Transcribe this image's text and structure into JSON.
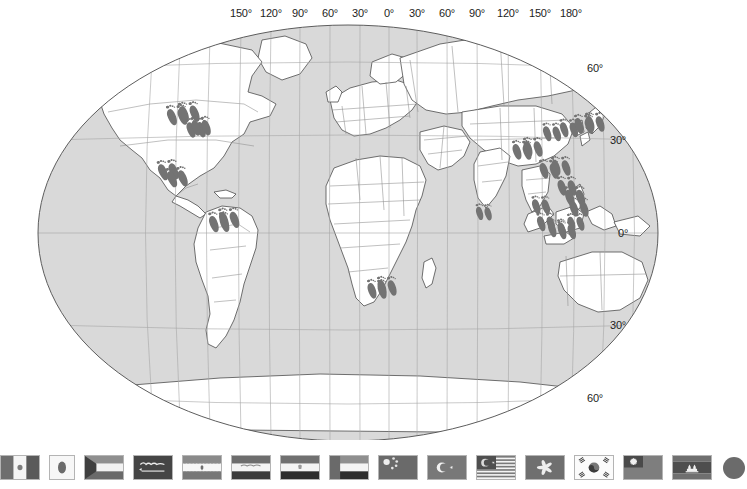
{
  "map": {
    "title": "World map with footprint markers",
    "projection": "Robinson",
    "ocean_color": "#d9d9d9",
    "land_color": "#ffffff",
    "border_color": "#8c8c8c",
    "coast_color": "#4d4d4d",
    "graticule_color": "#a6a6a6",
    "marker_color": "#737373",
    "marker_icon": "footprint-icon",
    "longitude_labels": [
      {
        "text": "150°",
        "x": 241
      },
      {
        "text": "120°",
        "x": 271
      },
      {
        "text": "90°",
        "x": 300
      },
      {
        "text": "60°",
        "x": 330
      },
      {
        "text": "30°",
        "x": 360
      },
      {
        "text": "0°",
        "x": 389
      },
      {
        "text": "30°",
        "x": 417
      },
      {
        "text": "60°",
        "x": 447
      },
      {
        "text": "90°",
        "x": 477
      },
      {
        "text": "120°",
        "x": 508
      },
      {
        "text": "150°",
        "x": 540
      },
      {
        "text": "180°",
        "x": 571
      }
    ],
    "latitude_labels": [
      {
        "text": "60°",
        "x": 587,
        "y": 68
      },
      {
        "text": "30°",
        "x": 610,
        "y": 140
      },
      {
        "text": "0°",
        "x": 618,
        "y": 233
      },
      {
        "text": "30°",
        "x": 610,
        "y": 325
      },
      {
        "text": "60°",
        "x": 587,
        "y": 398
      }
    ],
    "markers": [
      {
        "name": "united-states-west",
        "x": 176,
        "y": 115,
        "r": -12,
        "s": 1.0
      },
      {
        "name": "united-states-west2",
        "x": 188,
        "y": 112,
        "r": -12,
        "s": 1.0
      },
      {
        "name": "united-states-central",
        "x": 195,
        "y": 128,
        "r": -10,
        "s": 0.95
      },
      {
        "name": "united-states-east",
        "x": 200,
        "y": 126,
        "r": -10,
        "s": 0.95
      },
      {
        "name": "united-states-sw",
        "x": 167,
        "y": 170,
        "r": -14,
        "s": 1.0
      },
      {
        "name": "mexico",
        "x": 176,
        "y": 177,
        "r": -14,
        "s": 1.0
      },
      {
        "name": "colombia",
        "x": 218,
        "y": 222,
        "r": -10,
        "s": 1.0
      },
      {
        "name": "venezuela",
        "x": 228,
        "y": 218,
        "r": -10,
        "s": 1.0
      },
      {
        "name": "south-africa",
        "x": 376,
        "y": 289,
        "r": -8,
        "s": 0.95
      },
      {
        "name": "south-africa2",
        "x": 386,
        "y": 286,
        "r": -8,
        "s": 0.95
      },
      {
        "name": "india-south",
        "x": 483,
        "y": 212,
        "r": -6,
        "s": 0.8
      },
      {
        "name": "china-west",
        "x": 521,
        "y": 150,
        "r": -8,
        "s": 0.95
      },
      {
        "name": "china-west2",
        "x": 532,
        "y": 147,
        "r": -8,
        "s": 0.95
      },
      {
        "name": "china-east",
        "x": 551,
        "y": 132,
        "r": -8,
        "s": 0.9
      },
      {
        "name": "korea",
        "x": 568,
        "y": 128,
        "r": -8,
        "s": 0.9
      },
      {
        "name": "japan",
        "x": 583,
        "y": 124,
        "r": -8,
        "s": 0.95
      },
      {
        "name": "japan2",
        "x": 594,
        "y": 122,
        "r": -8,
        "s": 0.95
      },
      {
        "name": "china-south",
        "x": 548,
        "y": 169,
        "r": -8,
        "s": 0.95
      },
      {
        "name": "china-south2",
        "x": 560,
        "y": 166,
        "r": -8,
        "s": 0.95
      },
      {
        "name": "taiwan",
        "x": 566,
        "y": 186,
        "r": -8,
        "s": 0.95
      },
      {
        "name": "philippines",
        "x": 574,
        "y": 196,
        "r": -8,
        "s": 1.0
      },
      {
        "name": "philippines2",
        "x": 578,
        "y": 207,
        "r": -8,
        "s": 0.95
      },
      {
        "name": "vietnam",
        "x": 540,
        "y": 205,
        "r": -8,
        "s": 0.9
      },
      {
        "name": "malaysia",
        "x": 545,
        "y": 222,
        "r": -8,
        "s": 0.9
      },
      {
        "name": "indonesia-west",
        "x": 556,
        "y": 228,
        "r": -8,
        "s": 0.9
      },
      {
        "name": "indonesia-java",
        "x": 566,
        "y": 230,
        "r": -8,
        "s": 0.9
      },
      {
        "name": "singapore",
        "x": 575,
        "y": 222,
        "r": -8,
        "s": 0.85
      }
    ]
  },
  "flags": [
    {
      "name": "united-states",
      "label": "United States"
    },
    {
      "name": "mexico",
      "label": "Mexico"
    },
    {
      "name": "japan-small",
      "label": "Japan"
    },
    {
      "name": "kuwait",
      "label": "Kuwait"
    },
    {
      "name": "saudi-arabia",
      "label": "Saudi Arabia"
    },
    {
      "name": "iran",
      "label": "Iran"
    },
    {
      "name": "iraq",
      "label": "Iraq"
    },
    {
      "name": "egypt",
      "label": "Egypt"
    },
    {
      "name": "united-arab-emirates",
      "label": "United Arab Emirates"
    },
    {
      "name": "china",
      "label": "China"
    },
    {
      "name": "turkey",
      "label": "Turkey"
    },
    {
      "name": "malaysia",
      "label": "Malaysia"
    },
    {
      "name": "hong-kong",
      "label": "Hong Kong"
    },
    {
      "name": "south-korea",
      "label": "South Korea"
    },
    {
      "name": "taiwan",
      "label": "Taiwan"
    },
    {
      "name": "cambodia",
      "label": "Cambodia"
    },
    {
      "name": "japan",
      "label": "Japan"
    }
  ]
}
